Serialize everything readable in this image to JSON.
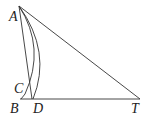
{
  "diagram": {
    "type": "geometry",
    "points": {
      "A": {
        "label": "A",
        "x": 19,
        "y": 6
      },
      "B": {
        "label": "B",
        "x": 21,
        "y": 99
      },
      "C": {
        "label": "C",
        "x": 25,
        "y": 94
      },
      "D": {
        "label": "D",
        "x": 33,
        "y": 99
      },
      "T": {
        "label": "T",
        "x": 140,
        "y": 99
      }
    },
    "segments": [
      "AD",
      "AT",
      "BT"
    ],
    "arcs": [
      "AC",
      "AD"
    ],
    "stroke_color": "#333333"
  }
}
